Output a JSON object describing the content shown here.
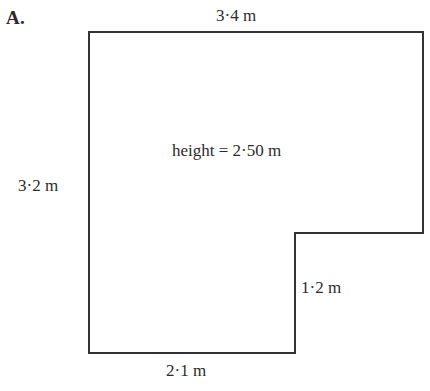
{
  "figure": {
    "item_letter": "A.",
    "shape_name": "l-shaped-prism-cross-section",
    "line_color": "#333333",
    "background_color": "#ffffff",
    "stroke_width": 2,
    "vertices": [
      {
        "x": 89,
        "y": 32
      },
      {
        "x": 423,
        "y": 32
      },
      {
        "x": 423,
        "y": 233
      },
      {
        "x": 295,
        "y": 233
      },
      {
        "x": 295,
        "y": 353
      },
      {
        "x": 89,
        "y": 353
      }
    ],
    "labels": {
      "top": "3·4 m",
      "left": "3·2 m",
      "bottom": "2·1 m",
      "notch_vertical": "1·2 m",
      "height": "height = 2·50 m"
    },
    "dimensions": [
      {
        "side": "top",
        "value": 3.4,
        "unit": "m",
        "text": "3·4 m"
      },
      {
        "side": "left",
        "value": 3.2,
        "unit": "m",
        "text": "3·2 m"
      },
      {
        "side": "bottom",
        "value": 2.1,
        "unit": "m",
        "text": "2·1 m"
      },
      {
        "side": "notch-vertical",
        "value": 1.2,
        "unit": "m",
        "text": "1·2 m"
      },
      {
        "side": "prism-height",
        "value": 2.5,
        "unit": "m",
        "text": "2·50 m"
      }
    ]
  }
}
